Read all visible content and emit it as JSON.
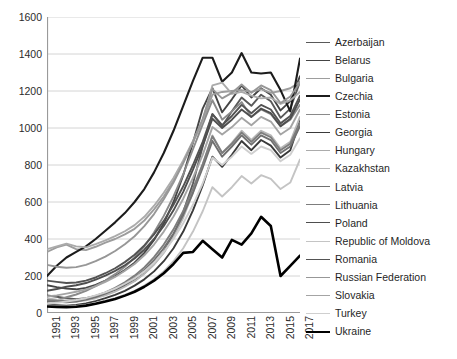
{
  "chart_data": {
    "type": "line",
    "title": "",
    "xlabel": "",
    "ylabel": "",
    "ylim": [
      0,
      1600
    ],
    "ytick_step": 200,
    "yticks": [
      0,
      200,
      400,
      600,
      800,
      1000,
      1200,
      1400,
      1600
    ],
    "grid": true,
    "grid_axis": "y",
    "legend_position": "right",
    "x": [
      1991,
      1992,
      1993,
      1994,
      1995,
      1996,
      1997,
      1998,
      1999,
      2000,
      2001,
      2002,
      2003,
      2004,
      2005,
      2006,
      2007,
      2008,
      2009,
      2010,
      2011,
      2012,
      2013,
      2014,
      2015,
      2016,
      2017
    ],
    "xtick_labels": [
      "1991",
      "1993",
      "1995",
      "1997",
      "1999",
      "2001",
      "2003",
      "2005",
      "2007",
      "2009",
      "2011",
      "2013",
      "2015",
      "2017"
    ],
    "xtick_rotation": 90,
    "series": [
      {
        "name": "Azerbaijan",
        "color": "#595959",
        "width": 1.9,
        "values": [
          95,
          88,
          80,
          75,
          80,
          92,
          108,
          125,
          148,
          175,
          215,
          265,
          330,
          420,
          545,
          700,
          900,
          1075,
          1010,
          1090,
          1165,
          1120,
          1180,
          1145,
          1055,
          1105,
          1250
        ]
      },
      {
        "name": "Belarus",
        "color": "#444444",
        "width": 1.9,
        "values": [
          150,
          140,
          132,
          128,
          136,
          152,
          175,
          200,
          232,
          272,
          325,
          395,
          485,
          600,
          745,
          920,
          1105,
          1215,
          1085,
          1155,
          1230,
          1165,
          1215,
          1180,
          1095,
          1145,
          1280
        ]
      },
      {
        "name": "Bulgaria",
        "color": "#9d9d9d",
        "width": 1.9,
        "values": [
          330,
          355,
          370,
          345,
          340,
          358,
          380,
          400,
          425,
          455,
          500,
          560,
          630,
          715,
          815,
          925,
          1035,
          1180,
          1195,
          1200,
          1205,
          1195,
          1210,
          1190,
          1200,
          1215,
          1250
        ]
      },
      {
        "name": "Czechia",
        "color": "#1c1c1c",
        "width": 2.1,
        "values": [
          200,
          255,
          300,
          330,
          360,
          400,
          445,
          490,
          540,
          600,
          670,
          760,
          865,
          985,
          1120,
          1255,
          1380,
          1380,
          1250,
          1300,
          1405,
          1300,
          1295,
          1300,
          1205,
          1090,
          1375
        ]
      },
      {
        "name": "Estonia",
        "color": "#8a8a8a",
        "width": 1.9,
        "values": [
          60,
          70,
          85,
          100,
          120,
          145,
          175,
          210,
          250,
          300,
          360,
          435,
          525,
          630,
          750,
          885,
          1020,
          1150,
          1045,
          1090,
          1140,
          1060,
          1100,
          1075,
          1010,
          1045,
          1125
        ]
      },
      {
        "name": "Georgia",
        "color": "#3a3a3a",
        "width": 1.9,
        "values": [
          45,
          42,
          40,
          44,
          52,
          64,
          80,
          98,
          120,
          148,
          182,
          225,
          280,
          350,
          440,
          555,
          690,
          845,
          790,
          855,
          930,
          880,
          935,
          905,
          840,
          880,
          1040
        ]
      },
      {
        "name": "Hungary",
        "color": "#ababab",
        "width": 1.9,
        "values": [
          345,
          360,
          375,
          360,
          355,
          372,
          392,
          415,
          442,
          475,
          520,
          580,
          650,
          730,
          825,
          930,
          1040,
          1230,
          1245,
          1185,
          1195,
          1175,
          1160,
          1165,
          1130,
          1150,
          1195
        ]
      },
      {
        "name": "Kazakhstan",
        "color": "#b8b8b8",
        "width": 1.9,
        "values": [
          80,
          72,
          66,
          62,
          68,
          80,
          96,
          116,
          142,
          172,
          212,
          262,
          325,
          410,
          515,
          650,
          800,
          960,
          865,
          920,
          985,
          935,
          985,
          960,
          890,
          925,
          1060
        ]
      },
      {
        "name": "Latvia",
        "color": "#707070",
        "width": 1.9,
        "values": [
          65,
          60,
          58,
          62,
          72,
          86,
          105,
          128,
          156,
          190,
          232,
          285,
          350,
          430,
          530,
          650,
          785,
          930,
          845,
          900,
          960,
          910,
          960,
          935,
          865,
          900,
          1010
        ]
      },
      {
        "name": "Lithuania",
        "color": "#7d7d7d",
        "width": 1.9,
        "values": [
          70,
          66,
          64,
          68,
          78,
          92,
          112,
          136,
          166,
          202,
          246,
          302,
          370,
          452,
          552,
          672,
          805,
          955,
          865,
          915,
          975,
          925,
          975,
          950,
          880,
          915,
          1030
        ]
      },
      {
        "name": "Poland",
        "color": "#4e4e4e",
        "width": 1.9,
        "values": [
          120,
          130,
          142,
          150,
          162,
          180,
          202,
          228,
          258,
          295,
          342,
          400,
          470,
          555,
          655,
          775,
          905,
          1050,
          1000,
          1045,
          1100,
          1060,
          1105,
          1080,
          1010,
          1050,
          1155
        ]
      },
      {
        "name": "Republic of Moldova",
        "color": "#c4c4c4",
        "width": 1.9,
        "values": [
          40,
          38,
          36,
          38,
          44,
          54,
          66,
          80,
          98,
          120,
          148,
          182,
          225,
          280,
          350,
          440,
          550,
          680,
          630,
          680,
          740,
          700,
          745,
          725,
          670,
          705,
          830
        ]
      },
      {
        "name": "Romania",
        "color": "#535353",
        "width": 1.9,
        "values": [
          175,
          168,
          162,
          165,
          175,
          192,
          215,
          242,
          275,
          315,
          365,
          425,
          498,
          585,
          685,
          800,
          925,
          1075,
          1015,
          1065,
          1125,
          1080,
          1125,
          1100,
          1025,
          1065,
          1175
        ]
      },
      {
        "name": "Russian Federation",
        "color": "#979797",
        "width": 1.9,
        "values": [
          260,
          250,
          245,
          248,
          260,
          280,
          305,
          335,
          372,
          415,
          470,
          535,
          615,
          705,
          810,
          925,
          1050,
          1210,
          1160,
          1190,
          1235,
          1190,
          1230,
          1205,
          1135,
          1170,
          1245
        ]
      },
      {
        "name": "Slovakia",
        "color": "#a4a4a4",
        "width": 1.9,
        "values": [
          90,
          95,
          105,
          115,
          128,
          145,
          168,
          195,
          228,
          265,
          312,
          370,
          440,
          522,
          618,
          730,
          855,
          1005,
          965,
          1005,
          1055,
          1015,
          1060,
          1035,
          965,
          1000,
          1100
        ]
      },
      {
        "name": "Turkey",
        "color": "#cfcfcf",
        "width": 1.9,
        "values": [
          50,
          55,
          62,
          70,
          80,
          95,
          112,
          132,
          158,
          188,
          225,
          272,
          330,
          400,
          485,
          585,
          700,
          840,
          800,
          845,
          900,
          860,
          900,
          880,
          820,
          855,
          945
        ]
      },
      {
        "name": "Ukraine",
        "color": "#000000",
        "width": 2.6,
        "values": [
          35,
          33,
          32,
          34,
          40,
          50,
          62,
          76,
          94,
          115,
          142,
          175,
          215,
          265,
          325,
          330,
          390,
          345,
          300,
          395,
          370,
          430,
          520,
          470,
          200,
          255,
          310
        ]
      }
    ]
  }
}
